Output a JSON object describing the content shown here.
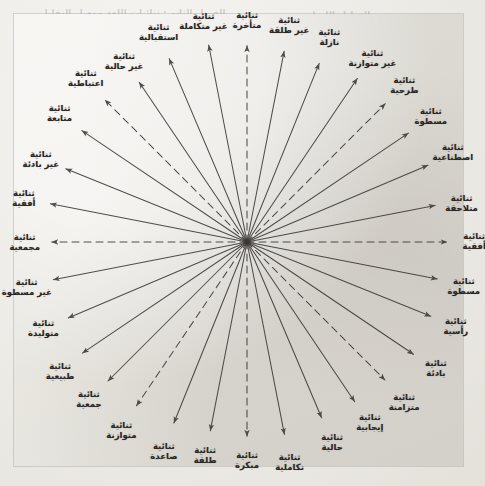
{
  "figure": {
    "kind": "radial-star-diagram",
    "title": "",
    "center_label": "",
    "script_direction": "rtl",
    "language": "ar",
    "center": {
      "x": 233,
      "y": 228
    },
    "radius_px": 196,
    "line_color": "#3a3734",
    "label_color": "#2a2724",
    "background_color": "#e9e7e1",
    "page_color": "#eceae5",
    "total_spokes": 32,
    "dashed_spoke_count": 6
  },
  "chart_data": {
    "type": "scatter",
    "title": "",
    "xlabel": "",
    "ylabel": "",
    "legend": [],
    "nodes": [
      {
        "id": 1,
        "angle_deg": 0,
        "line_style": "dashed",
        "line1": "ثنائية",
        "line2": "أفقية"
      },
      {
        "id": 2,
        "angle_deg": 11,
        "line_style": "solid",
        "line1": "ثنائية",
        "line2": "متلاحقة"
      },
      {
        "id": 3,
        "angle_deg": 23,
        "line_style": "solid",
        "line1": "ثنائية",
        "line2": "اصطناعية"
      },
      {
        "id": 4,
        "angle_deg": 34,
        "line_style": "solid",
        "line1": "ثنائية",
        "line2": "مسطوة"
      },
      {
        "id": 5,
        "angle_deg": 45,
        "line_style": "dashed",
        "line1": "ثنائية",
        "line2": "طرحية"
      },
      {
        "id": 6,
        "angle_deg": 56,
        "line_style": "solid",
        "line1": "ثنائية",
        "line2": "غير متوازنة"
      },
      {
        "id": 7,
        "angle_deg": 68,
        "line_style": "solid",
        "line1": "ثنائية",
        "line2": "نازلة"
      },
      {
        "id": 8,
        "angle_deg": 79,
        "line_style": "solid",
        "line1": "ثنائية",
        "line2": "غير طلقة"
      },
      {
        "id": 9,
        "angle_deg": 90,
        "line_style": "dashed",
        "line1": "ثنائية",
        "line2": "متأخرة"
      },
      {
        "id": 10,
        "angle_deg": 101,
        "line_style": "solid",
        "line1": "ثنائية",
        "line2": "غير متكاملة"
      },
      {
        "id": 11,
        "angle_deg": 113,
        "line_style": "solid",
        "line1": "ثنائية",
        "line2": "استقبالية"
      },
      {
        "id": 12,
        "angle_deg": 124,
        "line_style": "solid",
        "line1": "ثنائية",
        "line2": "غير حالية"
      },
      {
        "id": 13,
        "angle_deg": 135,
        "line_style": "dashed",
        "line1": "ثنائية",
        "line2": "اعتباطية"
      },
      {
        "id": 14,
        "angle_deg": 146,
        "line_style": "solid",
        "line1": "ثنائية",
        "line2": "متابعة"
      },
      {
        "id": 15,
        "angle_deg": 158,
        "line_style": "solid",
        "line1": "ثنائية",
        "line2": "غير بادئة"
      },
      {
        "id": 16,
        "angle_deg": 169,
        "line_style": "solid",
        "line1": "ثنائية",
        "line2": "أفقية"
      },
      {
        "id": 17,
        "angle_deg": 180,
        "line_style": "dashed",
        "line1": "ثنائية",
        "line2": "مجمعية"
      },
      {
        "id": 18,
        "angle_deg": 191,
        "line_style": "solid",
        "line1": "ثنائية",
        "line2": "غير مسطوة"
      },
      {
        "id": 19,
        "angle_deg": 203,
        "line_style": "solid",
        "line1": "ثنائية",
        "line2": "متوليدة"
      },
      {
        "id": 20,
        "angle_deg": 214,
        "line_style": "solid",
        "line1": "ثنائية",
        "line2": "طبيعية"
      },
      {
        "id": 21,
        "angle_deg": 225,
        "line_style": "solid",
        "line1": "ثنائية",
        "line2": "جمعية"
      },
      {
        "id": 22,
        "angle_deg": 236,
        "line_style": "dashed",
        "line1": "ثنائية",
        "line2": "متوازنة"
      },
      {
        "id": 23,
        "angle_deg": 248,
        "line_style": "solid",
        "line1": "ثنائية",
        "line2": "صاعدة"
      },
      {
        "id": 24,
        "angle_deg": 259,
        "line_style": "solid",
        "line1": "ثنائية",
        "line2": "طلقة"
      },
      {
        "id": 25,
        "angle_deg": 270,
        "line_style": "dashed",
        "line1": "ثنائية",
        "line2": "مبكرة"
      },
      {
        "id": 26,
        "angle_deg": 281,
        "line_style": "solid",
        "line1": "ثنائية",
        "line2": "تكاملية"
      },
      {
        "id": 27,
        "angle_deg": 293,
        "line_style": "solid",
        "line1": "ثنائية",
        "line2": "حالية"
      },
      {
        "id": 28,
        "angle_deg": 304,
        "line_style": "solid",
        "line1": "ثنائية",
        "line2": "إيجابية"
      },
      {
        "id": 29,
        "angle_deg": 315,
        "line_style": "dashed",
        "line1": "ثنائية",
        "line2": "متزامنة"
      },
      {
        "id": 30,
        "angle_deg": 326,
        "line_style": "solid",
        "line1": "ثنائية",
        "line2": "بادئة"
      },
      {
        "id": 31,
        "angle_deg": 338,
        "line_style": "solid",
        "line1": "ثنائية",
        "line2": "رأسية"
      },
      {
        "id": 32,
        "angle_deg": 349,
        "line_style": "solid",
        "line1": "ثنائية",
        "line2": "مسطوة"
      }
    ]
  },
  "background_text": {
    "note": "Faint show-through of printed text on the underlying page behind the pasted figure.",
    "lines": [
      {
        "x": 40,
        "y": 8,
        "size": 9,
        "text": "الفصل الثاني: ثنائيات اللغة ومعيار التقابل"
      },
      {
        "x": 300,
        "y": 10,
        "size": 9,
        "text": "التحليل اللساني"
      },
      {
        "x": 16,
        "y": 44,
        "size": 10,
        "text": "reciprocal"
      },
      {
        "x": 120,
        "y": 46,
        "size": 9,
        "text": "opposition"
      },
      {
        "x": 16,
        "y": 84,
        "size": 10,
        "text": "distinctive"
      },
      {
        "x": 150,
        "y": 86,
        "size": 9,
        "text": "binary"
      },
      {
        "x": 16,
        "y": 124,
        "size": 9,
        "text": "complementary"
      },
      {
        "x": 170,
        "y": 126,
        "size": 9,
        "text": "marked"
      },
      {
        "x": 16,
        "y": 214,
        "size": 9,
        "text": "syntagmatic"
      },
      {
        "x": 150,
        "y": 216,
        "size": 9,
        "text": "paradigmatic"
      },
      {
        "x": 16,
        "y": 240,
        "size": 9,
        "text": "neutral"
      },
      {
        "x": 300,
        "y": 330,
        "size": 9,
        "text": "equipollent"
      }
    ]
  }
}
